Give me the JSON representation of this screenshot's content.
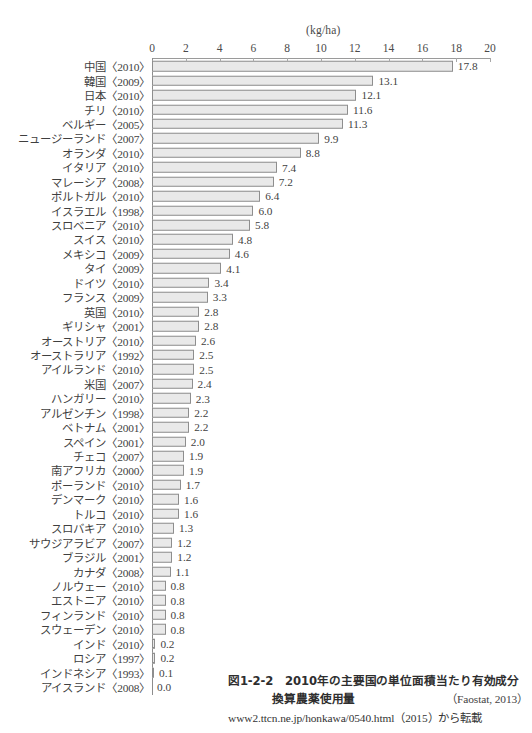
{
  "chart_data": {
    "type": "bar",
    "orientation": "horizontal",
    "figure_number": "図1-2-2",
    "xlabel": "(kg/ha)",
    "ylabel": "",
    "unit": "kg/ha",
    "xlim": [
      0,
      20
    ],
    "xticks": [
      0,
      2,
      4,
      6,
      8,
      10,
      12,
      14,
      16,
      18,
      20
    ],
    "xtick_labels": [
      "0",
      "2",
      "4",
      "6",
      "8",
      "10",
      "12",
      "14",
      "16",
      "18",
      "20"
    ],
    "grid": false,
    "legend": null,
    "source": "(Faostat, 2013)",
    "attribution": "www2.ttcn.ne.jp/honkawa/0540.html（2015）から転載",
    "bar_color": "#e9e9e9",
    "bar_edge_color": "#8e8e8e",
    "categories": [
      "中国〈2010〉",
      "韓国〈2009〉",
      "日本〈2010〉",
      "チリ〈2010〉",
      "ベルギー〈2005〉",
      "ニュージーランド〈2007〉",
      "オランダ〈2010〉",
      "イタリア〈2010〉",
      "マレーシア〈2008〉",
      "ポルトガル〈2010〉",
      "イスラエル〈1998〉",
      "スロベニア〈2010〉",
      "スイス〈2010〉",
      "メキシコ〈2009〉",
      "タイ〈2009〉",
      "ドイツ〈2010〉",
      "フランス〈2009〉",
      "英国〈2010〉",
      "ギリシャ〈2001〉",
      "オーストリア〈2010〉",
      "オーストラリア〈1992〉",
      "アイルランド〈2010〉",
      "米国〈2007〉",
      "ハンガリー〈2010〉",
      "アルゼンチン〈1998〉",
      "ベトナム〈2001〉",
      "スペイン〈2001〉",
      "チェコ〈2007〉",
      "南アフリカ〈2000〉",
      "ポーランド〈2010〉",
      "デンマーク〈2010〉",
      "トルコ〈2010〉",
      "スロバキア〈2010〉",
      "サウジアラビア〈2007〉",
      "ブラジル〈2001〉",
      "カナダ〈2008〉",
      "ノルウェー〈2010〉",
      "エストニア〈2010〉",
      "フィンランド〈2010〉",
      "スウェーデン〈2010〉",
      "インド〈2010〉",
      "ロシア〈1997〉",
      "インドネシア〈1993〉",
      "アイスランド〈2008〉"
    ],
    "values": [
      17.8,
      13.1,
      12.1,
      11.6,
      11.3,
      9.9,
      8.8,
      7.4,
      7.2,
      6.4,
      6.0,
      5.8,
      4.8,
      4.6,
      4.1,
      3.4,
      3.3,
      2.8,
      2.8,
      2.6,
      2.5,
      2.5,
      2.4,
      2.3,
      2.2,
      2.2,
      2.0,
      1.9,
      1.9,
      1.7,
      1.6,
      1.6,
      1.3,
      1.2,
      1.2,
      1.1,
      0.8,
      0.8,
      0.8,
      0.8,
      0.2,
      0.2,
      0.1,
      0.0
    ],
    "value_labels": [
      "17.8",
      "13.1",
      "12.1",
      "11.6",
      "11.3",
      "9.9",
      "8.8",
      "7.4",
      "7.2",
      "6.4",
      "6.0",
      "5.8",
      "4.8",
      "4.6",
      "4.1",
      "3.4",
      "3.3",
      "2.8",
      "2.8",
      "2.6",
      "2.5",
      "2.5",
      "2.4",
      "2.3",
      "2.2",
      "2.2",
      "2.0",
      "1.9",
      "1.9",
      "1.7",
      "1.6",
      "1.6",
      "1.3",
      "1.2",
      "1.2",
      "1.1",
      "0.8",
      "0.8",
      "0.8",
      "0.8",
      "0.2",
      "0.2",
      "0.1",
      "0.0"
    ],
    "country_names": [
      "中国",
      "韓国",
      "日本",
      "チリ",
      "ベルギー",
      "ニュージーランド",
      "オランダ",
      "イタリア",
      "マレーシア",
      "ポルトガル",
      "イスラエル",
      "スロベニア",
      "スイス",
      "メキシコ",
      "タイ",
      "ドイツ",
      "フランス",
      "英国",
      "ギリシャ",
      "オーストリア",
      "オーストラリア",
      "アイルランド",
      "米国",
      "ハンガリー",
      "アルゼンチン",
      "ベトナム",
      "スペイン",
      "チェコ",
      "南アフリカ",
      "ポーランド",
      "デンマーク",
      "トルコ",
      "スロバキア",
      "サウジアラビア",
      "ブラジル",
      "カナダ",
      "ノルウェー",
      "エストニア",
      "フィンランド",
      "スウェーデン",
      "インド",
      "ロシア",
      "インドネシア",
      "アイスランド"
    ],
    "years": [
      "〈2010〉",
      "〈2009〉",
      "〈2010〉",
      "〈2010〉",
      "〈2005〉",
      "〈2007〉",
      "〈2010〉",
      "〈2010〉",
      "〈2008〉",
      "〈2010〉",
      "〈1998〉",
      "〈2010〉",
      "〈2010〉",
      "〈2009〉",
      "〈2009〉",
      "〈2010〉",
      "〈2009〉",
      "〈2010〉",
      "〈2001〉",
      "〈2010〉",
      "〈1992〉",
      "〈2010〉",
      "〈2007〉",
      "〈2010〉",
      "〈1998〉",
      "〈2001〉",
      "〈2001〉",
      "〈2007〉",
      "〈2000〉",
      "〈2010〉",
      "〈2010〉",
      "〈2010〉",
      "〈2010〉",
      "〈2007〉",
      "〈2001〉",
      "〈2008〉",
      "〈2010〉",
      "〈2010〉",
      "〈2010〉",
      "〈2010〉",
      "〈2010〉",
      "〈1997〉",
      "〈1993〉",
      "〈2008〉"
    ]
  },
  "caption": {
    "figure_number": "図1-2-2",
    "title_line1": "2010年の主要国の単位面積当たり有効成分",
    "title_line2": "換算農薬使用量",
    "source": "（Faostat, 2013）",
    "attribution": "www2.ttcn.ne.jp/honkawa/0540.html（2015）から転載"
  },
  "axis": {
    "unit_label": "(kg/ha)"
  }
}
